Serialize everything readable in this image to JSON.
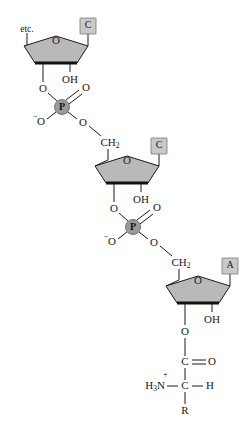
{
  "diagram": {
    "colors": {
      "ring_fill": "#b9b9b9",
      "base_box_fill": "#c9c9c9",
      "base_box_border": "#7a7a7a",
      "phosphorus_circle_fill": "#9a9a9a",
      "bond_color": "#1a1a1a",
      "background": "#ffffff"
    },
    "chain_label": "etc.",
    "nucleotides": [
      {
        "id": "nucleotide-1",
        "base": "C",
        "ring_oxygen": "O",
        "hydroxyl": "OH",
        "chain_end_label": "etc."
      },
      {
        "id": "nucleotide-2",
        "base": "C",
        "ring_oxygen": "O",
        "hydroxyl": "OH",
        "methylene": "CH",
        "methylene_subscript": "2"
      },
      {
        "id": "nucleotide-3",
        "base": "A",
        "ring_oxygen": "O",
        "hydroxyl": "OH",
        "methylene": "CH",
        "methylene_subscript": "2"
      }
    ],
    "phosphates": [
      {
        "id": "phosphate-1",
        "center": "P",
        "ester_oxygen_upper": "O",
        "double_bonded_oxygen": "O",
        "anionic_oxygen": "O",
        "anionic_charge": "−",
        "ester_oxygen_lower": "O"
      },
      {
        "id": "phosphate-2",
        "center": "P",
        "ester_oxygen_upper": "O",
        "double_bonded_oxygen": "O",
        "anionic_oxygen": "O",
        "anionic_charge": "−",
        "ester_oxygen_lower": "O"
      }
    ],
    "amino_acid": {
      "id": "aminoacyl-group",
      "ester_oxygen": "O",
      "carbonyl_carbon": "C",
      "carbonyl_oxygen": "O",
      "alpha_carbon": "C",
      "alpha_hydrogen": "H",
      "amino_group": "H",
      "amino_subscript": "3",
      "amino_nitrogen": "N",
      "amino_charge": "+",
      "side_chain": "R"
    }
  }
}
